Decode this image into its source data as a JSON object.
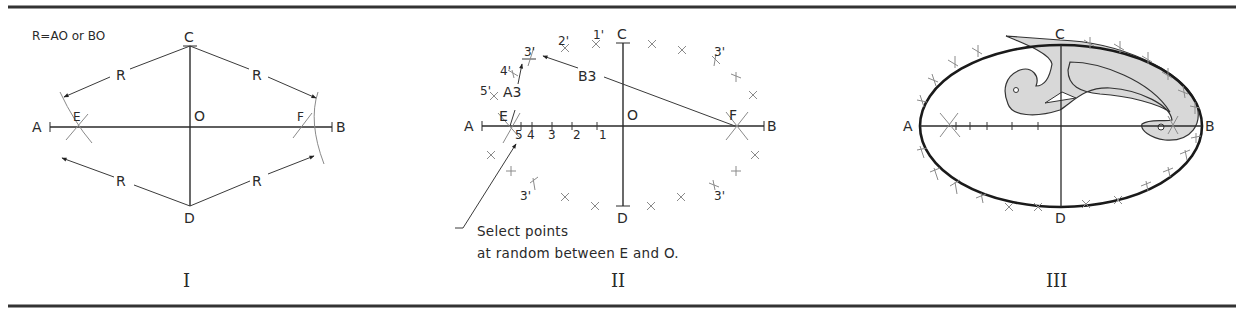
{
  "figure": {
    "panels": [
      {
        "numeral": "I",
        "formula": "R=AO or BO",
        "points": {
          "A": "A",
          "B": "B",
          "C": "C",
          "D": "D",
          "O": "O",
          "E": "E",
          "F": "F"
        },
        "radius_labels": [
          "R",
          "R",
          "R",
          "R"
        ]
      },
      {
        "numeral": "II",
        "points": {
          "A": "A",
          "B": "B",
          "C": "C",
          "D": "D",
          "O": "O",
          "E": "E",
          "F": "F"
        },
        "arc_labels": {
          "a3": "A3",
          "b3": "B3"
        },
        "division_labels": [
          "5",
          "4",
          "3",
          "2",
          "1"
        ],
        "prime_labels": [
          "1'",
          "2'",
          "3'",
          "4'",
          "5'",
          "3'",
          "3'",
          "3'"
        ],
        "note_line1": "Select points",
        "note_line2": "at random between E and O."
      },
      {
        "numeral": "III",
        "points": {
          "A": "A",
          "B": "B",
          "C": "C",
          "D": "D"
        }
      }
    ],
    "colors": {
      "ink": "#2a2a2a",
      "curve_fill": "#d8d8d8",
      "background": "#ffffff"
    }
  }
}
